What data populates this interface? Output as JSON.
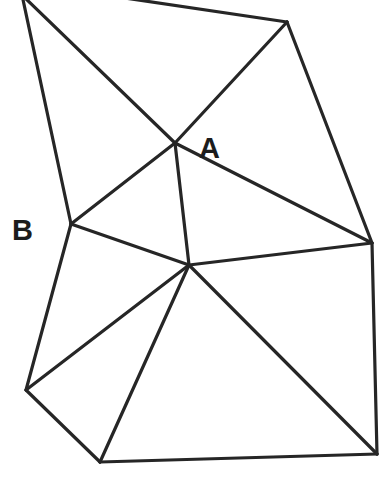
{
  "diagram": {
    "type": "triangulation",
    "stroke_color": "#262626",
    "background": "#ffffff",
    "labels": {
      "A": "A",
      "B": "B"
    },
    "vertices": {
      "TL": [
        22,
        -5
      ],
      "TM": [
        118,
        -3
      ],
      "TR": [
        287,
        22
      ],
      "A": [
        175,
        143
      ],
      "B": [
        71,
        224
      ],
      "C": [
        189,
        265
      ],
      "R": [
        372,
        243
      ],
      "L": [
        26,
        390
      ],
      "BL": [
        100,
        462
      ],
      "BR": [
        377,
        454
      ]
    },
    "edges": [
      [
        "TL",
        "B"
      ],
      [
        "TL",
        "A"
      ],
      [
        "TM",
        "TR"
      ],
      [
        "TR",
        "A"
      ],
      [
        "TR",
        "R"
      ],
      [
        "A",
        "B"
      ],
      [
        "A",
        "C"
      ],
      [
        "A",
        "R"
      ],
      [
        "B",
        "C"
      ],
      [
        "C",
        "R"
      ],
      [
        "B",
        "L"
      ],
      [
        "L",
        "C"
      ],
      [
        "L",
        "BL"
      ],
      [
        "BL",
        "C"
      ],
      [
        "C",
        "BR"
      ],
      [
        "BL",
        "BR"
      ],
      [
        "R",
        "BR"
      ]
    ]
  }
}
